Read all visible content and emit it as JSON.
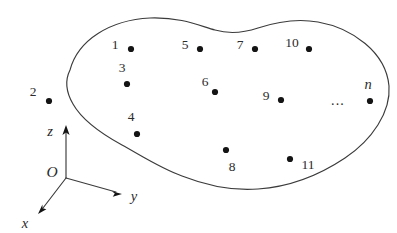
{
  "figure": {
    "background_color": "#ffffff",
    "stroke_color": "#3b3b3b",
    "dot_color": "#141414",
    "width": 397,
    "height": 233
  },
  "region": {
    "name": "closed-blob-outline",
    "shape": "irregular closed curve"
  },
  "axes": {
    "origin_label": "O",
    "z_label": "z",
    "y_label": "y",
    "x_label": "x",
    "origin": {
      "x": 66,
      "y": 178
    },
    "z_tip": {
      "x": 66,
      "y": 127
    },
    "y_tip": {
      "x": 121,
      "y": 194
    },
    "x_tip": {
      "x": 38,
      "y": 213
    },
    "z_label_pos": {
      "x": 50,
      "y": 131
    },
    "y_label_pos": {
      "x": 134,
      "y": 196
    },
    "x_label_pos": {
      "x": 25,
      "y": 223
    },
    "origin_label_pos": {
      "x": 52,
      "y": 172
    }
  },
  "points": [
    {
      "label": "1",
      "label_x": 115,
      "label_y": 45,
      "dot_x": 131,
      "dot_y": 49
    },
    {
      "label": "2",
      "label_x": 33,
      "label_y": 92,
      "dot_x": 49,
      "dot_y": 101
    },
    {
      "label": "3",
      "label_x": 122,
      "label_y": 68,
      "dot_x": 127,
      "dot_y": 84
    },
    {
      "label": "4",
      "label_x": 131,
      "label_y": 117,
      "dot_x": 137,
      "dot_y": 134
    },
    {
      "label": "5",
      "label_x": 185,
      "label_y": 45,
      "dot_x": 200,
      "dot_y": 49
    },
    {
      "label": "6",
      "label_x": 205,
      "label_y": 82,
      "dot_x": 215,
      "dot_y": 92
    },
    {
      "label": "7",
      "label_x": 240,
      "label_y": 45,
      "dot_x": 255,
      "dot_y": 49
    },
    {
      "label": "8",
      "label_x": 232,
      "label_y": 167,
      "dot_x": 226,
      "dot_y": 150
    },
    {
      "label": "9",
      "label_x": 266,
      "label_y": 96,
      "dot_x": 281,
      "dot_y": 100
    },
    {
      "label": "10",
      "label_x": 292,
      "label_y": 43,
      "dot_x": 309,
      "dot_y": 49
    },
    {
      "label": "11",
      "label_x": 308,
      "label_y": 165,
      "dot_x": 290,
      "dot_y": 159
    },
    {
      "label": "n",
      "label_x": 368,
      "label_y": 84,
      "dot_x": 370,
      "dot_y": 101
    }
  ],
  "ellipsis": {
    "text": "...",
    "x": 338,
    "y": 101
  }
}
